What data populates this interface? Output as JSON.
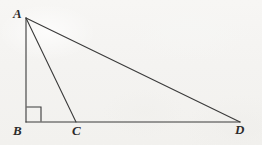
{
  "figure": {
    "kind": "geometry-diagram",
    "background_color": "#f5f4f2",
    "stroke_color": "#3a3a3a",
    "label_color": "#2b2b2b",
    "stroke_width": 1.1,
    "width": 262,
    "height": 145,
    "points": {
      "A": {
        "label": "A",
        "x": 26,
        "y": 18
      },
      "B": {
        "label": "B",
        "x": 26,
        "y": 122
      },
      "C": {
        "label": "C",
        "x": 76,
        "y": 122
      },
      "D": {
        "label": "D",
        "x": 240,
        "y": 122
      }
    },
    "segments": [
      {
        "name": "AB",
        "from": "A",
        "to": "B",
        "x1": 26,
        "y1": 18,
        "x2": 26,
        "y2": 122
      },
      {
        "name": "BD",
        "from": "B",
        "to": "D",
        "x1": 26,
        "y1": 122,
        "x2": 240,
        "y2": 122
      },
      {
        "name": "AD",
        "from": "A",
        "to": "D",
        "x1": 26,
        "y1": 18,
        "x2": 240,
        "y2": 122
      },
      {
        "name": "AC",
        "from": "A",
        "to": "C",
        "x1": 26,
        "y1": 18,
        "x2": 76,
        "y2": 122
      }
    ],
    "right_angle_marker": {
      "at": "B",
      "size": 14,
      "x": 27,
      "y": 107,
      "points": "41,121 41,107 27,107"
    }
  }
}
